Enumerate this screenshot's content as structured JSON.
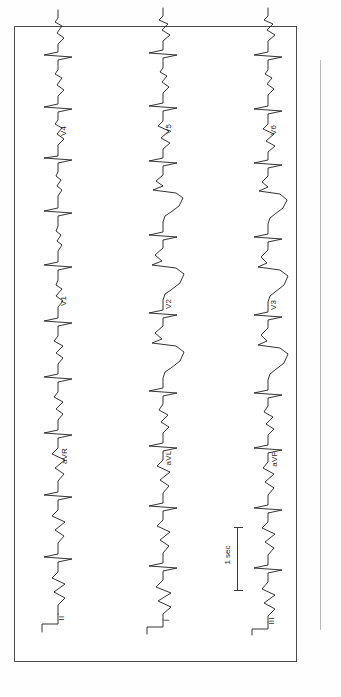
{
  "document": {
    "type": "12-lead electrocardiogram",
    "title": "12-lead ECG tracing",
    "orientation": "rotated-90-ccw",
    "paper_color": "#ffffff",
    "trace_color": "#1d1d1d",
    "frame_color": "#4a4a4a"
  },
  "scale": {
    "label": "1 sec",
    "bar_orientation": "vertical"
  },
  "rows": [
    {
      "name": "row-1",
      "x": 38,
      "leads": [
        {
          "label": "V4",
          "name": "lead-v4"
        },
        {
          "label": "V1",
          "name": "lead-v1"
        },
        {
          "label": "aVR",
          "name": "lead-avr"
        },
        {
          "label": "II",
          "name": "lead-ii"
        }
      ]
    },
    {
      "name": "row-2",
      "x": 143,
      "leads": [
        {
          "label": "V5",
          "name": "lead-v5"
        },
        {
          "label": "V2",
          "name": "lead-v2"
        },
        {
          "label": "aVL",
          "name": "lead-avl"
        },
        {
          "label": "I",
          "name": "lead-i"
        }
      ]
    },
    {
      "name": "row-3",
      "x": 248,
      "leads": [
        {
          "label": "V6",
          "name": "lead-v6"
        },
        {
          "label": "V3",
          "name": "lead-v3"
        },
        {
          "label": "aVF",
          "name": "lead-avf"
        },
        {
          "label": "III",
          "name": "lead-iii"
        }
      ]
    }
  ],
  "labels": {
    "r1_l1": "V4",
    "r1_l2": "V1",
    "r1_l3": "aVR",
    "r1_l4": "II",
    "r2_l1": "V5",
    "r2_l2": "V2",
    "r2_l3": "aVL",
    "r2_l4": "I",
    "r3_l1": "V6",
    "r3_l2": "V3",
    "r3_l3": "aVF",
    "r3_l4": "III",
    "scale": "1 sec"
  }
}
